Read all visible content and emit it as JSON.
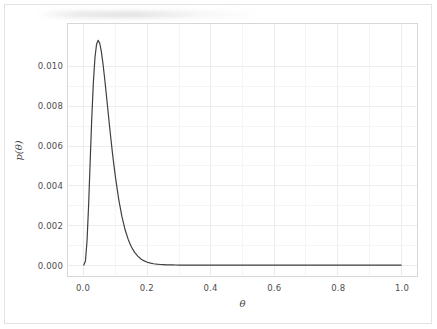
{
  "figure": {
    "background_color": "#ffffff",
    "border_color": "#e3e3e3"
  },
  "chart_data": {
    "type": "line",
    "title": "",
    "subtitle": "",
    "xlabel": "θ",
    "ylabel": "p(θ)",
    "xlim": [
      -0.05,
      1.05
    ],
    "ylim": [
      -0.00055,
      0.01215
    ],
    "xticks": [
      0.0,
      0.2,
      0.4,
      0.6,
      0.8,
      1.0
    ],
    "xticklabels": [
      "0.0",
      "0.2",
      "0.4",
      "0.6",
      "0.8",
      "1.0"
    ],
    "yticks": [
      0.0,
      0.002,
      0.004,
      0.006,
      0.008,
      0.01
    ],
    "yticklabels": [
      "0.000",
      "0.002",
      "0.004",
      "0.006",
      "0.008",
      "0.010"
    ],
    "grid": true,
    "minor_grid": true,
    "legend": null,
    "legend_position": "none",
    "series": [
      {
        "name": "p(θ)",
        "color": "#3f3f3f",
        "linewidth": 1.2,
        "peak_x": 0.05,
        "peak_y": 0.01133,
        "x": [
          0.0,
          0.005,
          0.01,
          0.015,
          0.02,
          0.025,
          0.03,
          0.035,
          0.04,
          0.045,
          0.05,
          0.055,
          0.06,
          0.065,
          0.07,
          0.075,
          0.08,
          0.085,
          0.09,
          0.095,
          0.1,
          0.11,
          0.12,
          0.13,
          0.14,
          0.15,
          0.16,
          0.17,
          0.18,
          0.19,
          0.2,
          0.21,
          0.22,
          0.23,
          0.24,
          0.25,
          0.26,
          0.27,
          0.28,
          0.29,
          0.3,
          0.32,
          0.34,
          0.36,
          0.38,
          0.4,
          0.45,
          0.5,
          0.55,
          0.6,
          0.65,
          0.7,
          0.75,
          0.8,
          0.85,
          0.9,
          0.95,
          1.0
        ],
        "y": [
          0.0,
          0.00021,
          0.00123,
          0.00303,
          0.00527,
          0.00744,
          0.00922,
          0.01046,
          0.01113,
          0.01133,
          0.01118,
          0.01077,
          0.01018,
          0.00948,
          0.00872,
          0.00793,
          0.00715,
          0.00639,
          0.00567,
          0.005,
          0.00438,
          0.0033,
          0.00244,
          0.00178,
          0.00128,
          0.00091,
          0.00064,
          0.00045,
          0.00031,
          0.00021,
          0.000145,
          9.85e-05,
          6.65e-05,
          4.47e-05,
          2.99e-05,
          2e-05,
          1.33e-05,
          8.8e-06,
          5.8e-06,
          3.8e-06,
          2.5e-06,
          1.1e-06,
          4.7e-07,
          2e-07,
          8e-08,
          3e-08,
          0.0,
          0.0,
          0.0,
          0.0,
          0.0,
          0.0,
          0.0,
          0.0,
          0.0,
          0.0,
          0.0,
          0.0
        ]
      }
    ]
  }
}
